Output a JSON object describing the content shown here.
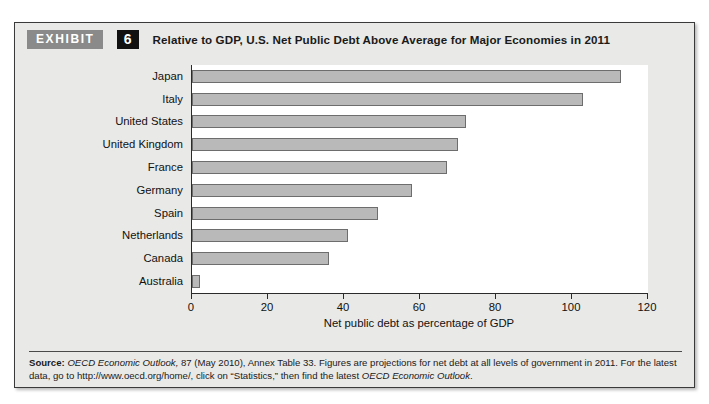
{
  "exhibit": {
    "badge_label": "EXHIBIT",
    "number": "6",
    "title": "Relative to GDP, U.S. Net Public Debt Above Average for Major Economies in 2011"
  },
  "source_note": {
    "label": "Source:",
    "part1_italic": "OECD Economic Outlook,",
    "part2": " 87 (May 2010), Annex Table 33. Figures are projections for net debt at all levels of government in 2011. For the latest data, go to http://www.oecd.org/home/, click on “Statistics,” then find the latest ",
    "part3_italic": "OECD Economic Outlook",
    "part4": "."
  },
  "chart_data": {
    "type": "bar",
    "orientation": "horizontal",
    "title": "Relative to GDP, U.S. Net Public Debt Above Average for Major Economies in 2011",
    "xlabel": "Net public debt as percentage of GDP",
    "ylabel": "",
    "xlim": [
      0,
      120
    ],
    "xticks": [
      0,
      20,
      40,
      60,
      80,
      100,
      120
    ],
    "xtick_labels": [
      "0",
      "20",
      "40",
      "60",
      "80",
      "100",
      "120"
    ],
    "grid": false,
    "legend": false,
    "bar_color": "#b9b9b9",
    "bar_border_color": "#6d6d6d",
    "categories": [
      "Japan",
      "Italy",
      "United States",
      "United Kingdom",
      "France",
      "Germany",
      "Spain",
      "Netherlands",
      "Canada",
      "Australia"
    ],
    "values": [
      113,
      103,
      72,
      70,
      67,
      58,
      49,
      41,
      36,
      2
    ]
  }
}
